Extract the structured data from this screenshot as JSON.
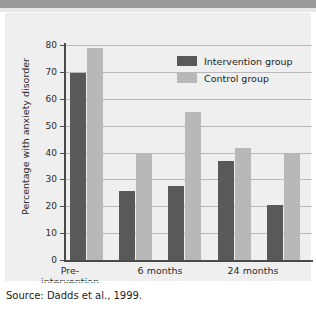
{
  "figure": {
    "source_note": "Source: Dadds et al., 1999."
  },
  "legend": {
    "position": "top-right",
    "items": [
      {
        "label": "Intervention group",
        "color": "#595959",
        "swatch": "legend-swatch-dark"
      },
      {
        "label": "Control group",
        "color": "#b8b8b8",
        "swatch": "legend-swatch-light"
      }
    ]
  },
  "axes": {
    "y_title": "Percentage with anxiety disorder",
    "y_ticks": [
      "0",
      "10",
      "20",
      "30",
      "40",
      "50",
      "60",
      "70",
      "80"
    ],
    "x_labels": [
      "Pre-\nintervention",
      "6 months",
      "24 months"
    ],
    "x_label_1_line1": "Pre-",
    "x_label_1_line2": "intervention",
    "x_label_2": "6 months",
    "x_label_3": "24 months"
  },
  "chart_data": {
    "type": "bar",
    "title": "",
    "subtitle": "",
    "xlabel": "",
    "ylabel": "Percentage with anxiety disorder",
    "ylim": [
      0,
      80
    ],
    "ytick_step": 10,
    "grid": true,
    "legend_position": "top-right",
    "categories": [
      "Pre-intervention",
      "",
      "6 months",
      "",
      "24 months"
    ],
    "series": [
      {
        "name": "Intervention group",
        "color": "#595959",
        "values": [
          69.5,
          25.5,
          27.5,
          37,
          20.5
        ]
      },
      {
        "name": "Control group",
        "color": "#b8b8b8",
        "values": [
          79,
          40,
          55,
          41.5,
          39.5
        ]
      }
    ],
    "annotations": [
      "Source: Dadds et al., 1999."
    ]
  }
}
